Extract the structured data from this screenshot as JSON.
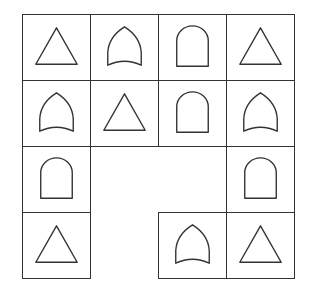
{
  "puzzle": {
    "grid": {
      "rows": 4,
      "cols": 4,
      "origin_x": 22,
      "origin_y": 14,
      "cell_w": 68,
      "cell_h": 66
    },
    "cells": [
      {
        "row": 0,
        "col": 0,
        "shape": "triangle"
      },
      {
        "row": 0,
        "col": 1,
        "shape": "pointed-arch"
      },
      {
        "row": 0,
        "col": 2,
        "shape": "round-arch"
      },
      {
        "row": 0,
        "col": 3,
        "shape": "triangle"
      },
      {
        "row": 1,
        "col": 0,
        "shape": "pointed-arch"
      },
      {
        "row": 1,
        "col": 1,
        "shape": "triangle"
      },
      {
        "row": 1,
        "col": 2,
        "shape": "round-arch"
      },
      {
        "row": 1,
        "col": 3,
        "shape": "pointed-arch"
      },
      {
        "row": 2,
        "col": 0,
        "shape": "round-arch"
      },
      {
        "row": 2,
        "col": 3,
        "shape": "round-arch"
      },
      {
        "row": 3,
        "col": 0,
        "shape": "triangle"
      },
      {
        "row": 3,
        "col": 2,
        "shape": "pointed-arch"
      },
      {
        "row": 3,
        "col": 3,
        "shape": "triangle"
      }
    ],
    "empty_cells": [
      {
        "row": 2,
        "col": 1
      },
      {
        "row": 2,
        "col": 2
      },
      {
        "row": 3,
        "col": 1
      }
    ],
    "colors": {
      "stroke": "#333333",
      "background": "#ffffff"
    }
  }
}
